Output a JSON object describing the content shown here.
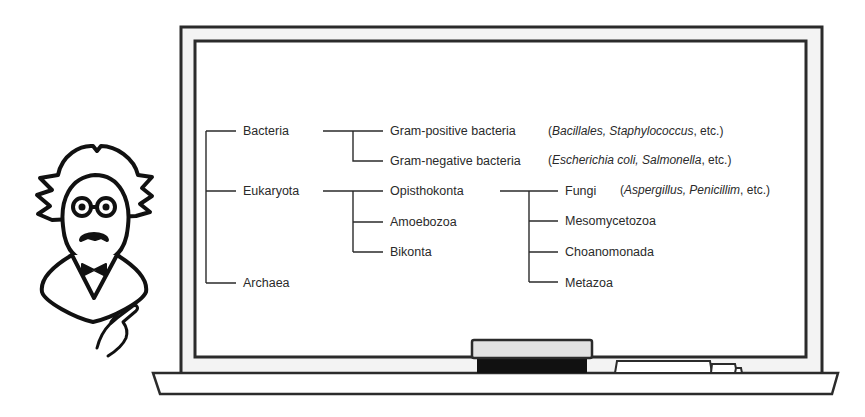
{
  "tree": {
    "root": {
      "children": [
        {
          "label": "Bacteria",
          "children": [
            {
              "label": "Gram-positive bacteria",
              "note": {
                "open": "(",
                "italic": "Bacillales, Staphylococcus",
                "rest": ", etc.)"
              }
            },
            {
              "label": "Gram-negative bacteria",
              "note": {
                "open": "(",
                "italic": "Escherichia coli, Salmonella",
                "rest": ", etc.)"
              }
            }
          ]
        },
        {
          "label": "Eukaryota",
          "children": [
            {
              "label": "Opisthokonta",
              "children": [
                {
                  "label": "Fungi",
                  "note": {
                    "open": "(",
                    "italic": "Aspergillus, Penicillim",
                    "rest": ", etc.)"
                  }
                },
                {
                  "label": "Mesomycetozoa"
                },
                {
                  "label": "Choanomonada"
                },
                {
                  "label": "Metazoa"
                }
              ]
            },
            {
              "label": "Amoebozoa"
            },
            {
              "label": "Bikonta"
            }
          ]
        },
        {
          "label": "Archaea"
        }
      ]
    }
  },
  "colors": {
    "line": "#2b2b2b",
    "board": "#ffffff",
    "frame": "#f2f2f2",
    "eraser_top": "#e2e2e2",
    "eraser_felt": "#111111"
  }
}
